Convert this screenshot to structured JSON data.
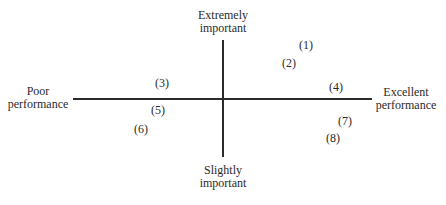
{
  "axes": {
    "top_label": [
      "Extremely",
      "important"
    ],
    "bottom_label": [
      "Slightly",
      "important"
    ],
    "left_label": [
      "Poor",
      "performance"
    ],
    "right_label": [
      "Excellent",
      "performance"
    ]
  },
  "points": [
    {
      "label": "(1)",
      "x": 306,
      "y": 45
    },
    {
      "label": "(2)",
      "x": 289,
      "y": 63
    },
    {
      "label": "(3)",
      "x": 162,
      "y": 83
    },
    {
      "label": "(4)",
      "x": 336,
      "y": 87
    },
    {
      "label": "(5)",
      "x": 158,
      "y": 110
    },
    {
      "label": "(6)",
      "x": 141,
      "y": 129
    },
    {
      "label": "(7)",
      "x": 345,
      "y": 121
    },
    {
      "label": "(8)",
      "x": 333,
      "y": 138
    }
  ]
}
